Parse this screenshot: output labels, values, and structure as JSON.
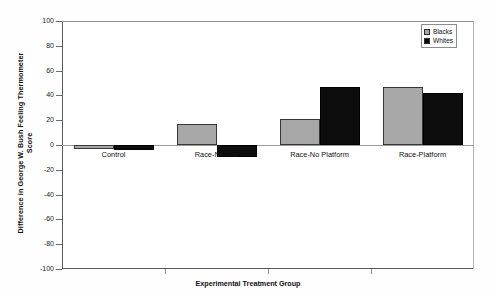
{
  "chart_data": {
    "type": "bar",
    "title": "",
    "xlabel": "Experimental Treatment Group",
    "ylabel": "Difference in George W. Bush Feeling Thermometer Score",
    "ylabel_line1": "Difference in George W. Bush Feeling Thermometer",
    "ylabel_line2": "Score",
    "categories": [
      "Control",
      "Race-Neutral",
      "Race-No Platform",
      "Race-Platform"
    ],
    "series": [
      {
        "name": "Blacks",
        "color": "#a8a8a8",
        "values": [
          -3,
          17,
          21,
          47
        ]
      },
      {
        "name": "Whites",
        "color": "#0d0d0d",
        "values": [
          -4,
          -10,
          47,
          42
        ]
      }
    ],
    "ylim": [
      -100,
      100
    ],
    "yticks": [
      100,
      80,
      60,
      40,
      20,
      0,
      -20,
      -40,
      -60,
      -80,
      -100
    ],
    "ytick_labels": [
      "100",
      "80",
      "60",
      "40",
      "20",
      "0",
      "-20",
      "-40",
      "-60",
      "-80",
      "-100"
    ],
    "grid": false,
    "legend_position": "top-right",
    "legend_entries": [
      "Blacks",
      "Whites"
    ]
  },
  "legend": {
    "items": [
      {
        "label": "Blacks"
      },
      {
        "label": "Whites"
      }
    ]
  },
  "axis": {
    "y_title_line1": "Difference in George W. Bush Feeling Thermometer",
    "y_title_line2": "Score",
    "x_title": "Experimental Treatment Group",
    "y_labels": [
      "100",
      "80",
      "60",
      "40",
      "20",
      "0",
      "-20",
      "-40",
      "-60",
      "-80",
      "-100"
    ],
    "x_labels": [
      "Control",
      "Race-Neutral",
      "Race-No Platform",
      "Race-Platform"
    ]
  }
}
